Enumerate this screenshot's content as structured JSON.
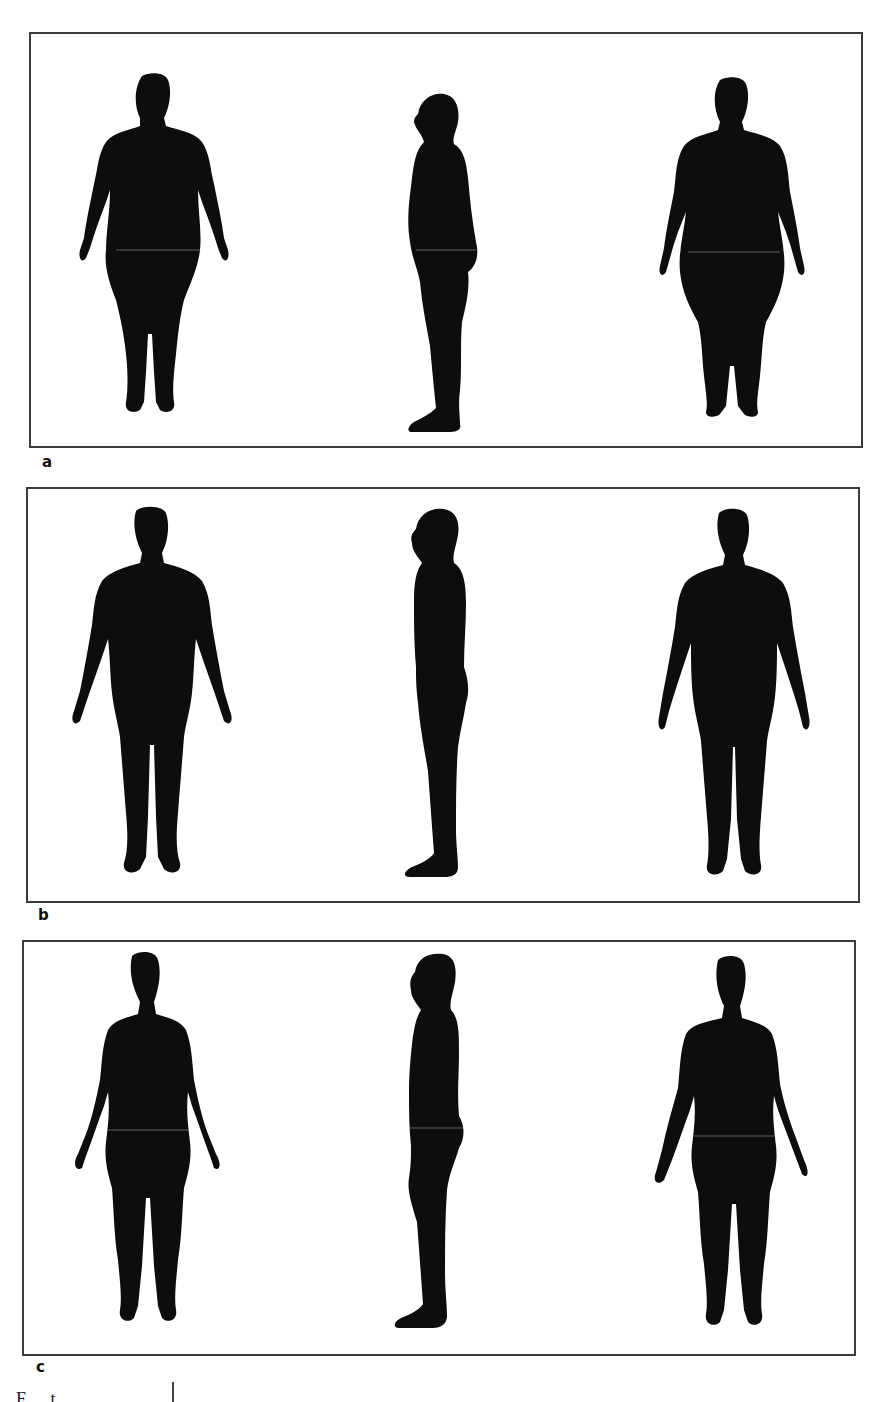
{
  "figure": {
    "panels": [
      {
        "label": "a",
        "description": "Obese body type silhouettes",
        "views": [
          "front",
          "side",
          "back"
        ]
      },
      {
        "label": "b",
        "description": "Average/muscular body type silhouettes",
        "views": [
          "front",
          "side",
          "back"
        ]
      },
      {
        "label": "c",
        "description": "Slender body type silhouettes",
        "views": [
          "front",
          "side",
          "back"
        ]
      }
    ],
    "caption_fragment": "F          t",
    "colors": {
      "silhouette": "#0d0d0d",
      "border": "#3a3a3a",
      "background": "#ffffff"
    }
  }
}
